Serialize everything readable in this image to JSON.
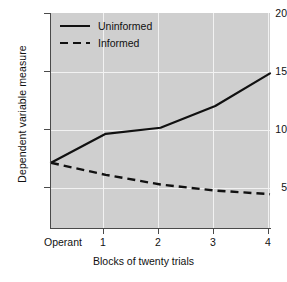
{
  "chart_data": {
    "type": "line",
    "title": "",
    "xlabel": "Blocks of twenty trials",
    "ylabel": "Dependent variable measure",
    "x": [
      0,
      1,
      2,
      3,
      4
    ],
    "xticklabels": [
      "Operant",
      "1",
      "2",
      "3",
      "4"
    ],
    "yticks": [
      5,
      10,
      15,
      20
    ],
    "yticklabels": [
      "5",
      "10",
      "15",
      "20"
    ],
    "xlim": [
      0,
      4
    ],
    "ylim": [
      2.2,
      20
    ],
    "grid": true,
    "grid_color": "#f2f2f2",
    "plot_background": "#cfcfcf",
    "legend_position": "upper left",
    "series": [
      {
        "name": "Uninformed",
        "style": "solid",
        "color": "#111111",
        "values": [
          7.6,
          10.0,
          10.5,
          12.3,
          15.0
        ]
      },
      {
        "name": "Informed",
        "style": "dashed",
        "color": "#111111",
        "values": [
          7.6,
          6.6,
          5.8,
          5.3,
          5.0
        ]
      }
    ]
  },
  "legend": {
    "items": [
      {
        "label": "Uninformed",
        "style": "solid"
      },
      {
        "label": "Informed",
        "style": "dashed"
      }
    ]
  },
  "axes": {
    "y_title": "Dependent variable measure",
    "x_title": "Blocks of twenty trials",
    "y_tick_labels": [
      "20",
      "15",
      "10",
      "5"
    ],
    "x_tick_labels": [
      "Operant",
      "1",
      "2",
      "3",
      "4"
    ]
  }
}
